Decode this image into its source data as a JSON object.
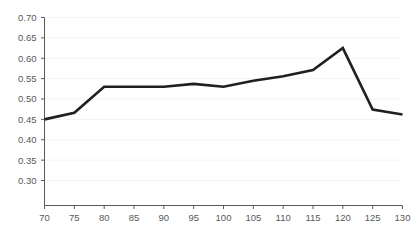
{
  "chart_data": {
    "type": "line",
    "title": "",
    "subtitle": "",
    "xlabel": "",
    "ylabel": "",
    "x": [
      70,
      75,
      80,
      85,
      90,
      95,
      100,
      105,
      110,
      115,
      120,
      125,
      130
    ],
    "values": [
      0.45,
      0.466,
      0.53,
      0.53,
      0.53,
      0.537,
      0.53,
      0.545,
      0.556,
      0.571,
      0.625,
      0.474,
      0.462
    ],
    "series": [
      {
        "name": "series-1",
        "values": [
          0.45,
          0.466,
          0.53,
          0.53,
          0.53,
          0.537,
          0.53,
          0.545,
          0.556,
          0.571,
          0.625,
          0.474,
          0.462
        ],
        "color": "#231f20"
      }
    ],
    "xlim": [
      70,
      130
    ],
    "ylim": [
      0.3,
      0.7
    ],
    "x_ticks": [
      70,
      75,
      80,
      85,
      90,
      95,
      100,
      105,
      110,
      115,
      120,
      125,
      130
    ],
    "x_tick_labels": [
      "70",
      "75",
      "80",
      "85",
      "90",
      "95",
      "100",
      "105",
      "110",
      "115",
      "120",
      "125",
      "130"
    ],
    "y_ticks": [
      0.3,
      0.35,
      0.4,
      0.45,
      0.5,
      0.55,
      0.6,
      0.65,
      0.7
    ],
    "y_tick_labels": [
      "0.30",
      "0.35",
      "0.40",
      "0.45",
      "0.50",
      "0.55",
      "0.60",
      "0.65",
      "0.70"
    ],
    "grid": true,
    "grid_color": "#f4f4f6",
    "legend": false,
    "legend_position": "none",
    "axis_color": "#58595b",
    "tick_label_color": "#58595b",
    "background_color": "#ffffff",
    "annotations": []
  }
}
